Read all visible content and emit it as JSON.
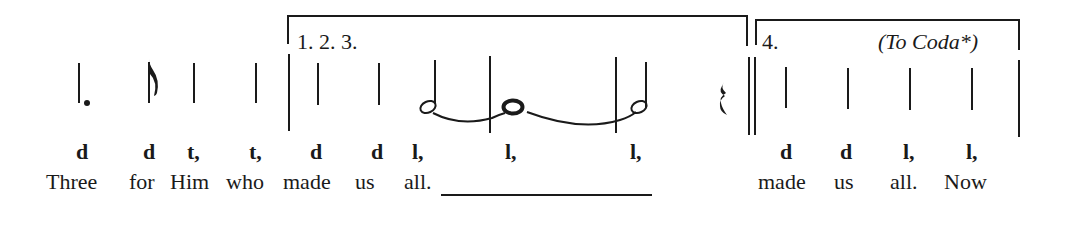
{
  "notation": {
    "endings": [
      {
        "label": "1. 2. 3."
      },
      {
        "label": "4.",
        "instruction": "(To Coda*)"
      }
    ],
    "solfa": [
      {
        "syllable": "d",
        "x": 80
      },
      {
        "syllable": "d",
        "x": 145
      },
      {
        "syllable": "t,",
        "x": 187
      },
      {
        "syllable": "t,",
        "x": 249
      },
      {
        "syllable": "d",
        "x": 310
      },
      {
        "syllable": "d",
        "x": 371
      },
      {
        "syllable": "l,",
        "x": 412
      },
      {
        "syllable": "l,",
        "x": 505
      },
      {
        "syllable": "l,",
        "x": 630
      },
      {
        "syllable": "d",
        "x": 780
      },
      {
        "syllable": "d",
        "x": 840
      },
      {
        "syllable": "l,",
        "x": 903
      },
      {
        "syllable": "l,",
        "x": 966
      }
    ],
    "lyrics": [
      {
        "text": "Three",
        "x": 46
      },
      {
        "text": "for",
        "x": 129
      },
      {
        "text": "Him",
        "x": 170
      },
      {
        "text": "who",
        "x": 226
      },
      {
        "text": "made",
        "x": 283
      },
      {
        "text": "us",
        "x": 355
      },
      {
        "text": "all.",
        "x": 404
      },
      {
        "text": "made",
        "x": 758
      },
      {
        "text": "us",
        "x": 834
      },
      {
        "text": "all.",
        "x": 890
      },
      {
        "text": "Now",
        "x": 944
      }
    ],
    "notes": [
      {
        "type": "dotted-quarter",
        "x": 79
      },
      {
        "type": "eighth",
        "x": 150
      },
      {
        "type": "quarter",
        "x": 194
      },
      {
        "type": "quarter",
        "x": 256
      },
      {
        "type": "quarter",
        "x": 318
      },
      {
        "type": "quarter",
        "x": 379
      },
      {
        "type": "half",
        "x": 434
      },
      {
        "type": "whole",
        "x": 506
      },
      {
        "type": "half",
        "x": 646
      },
      {
        "type": "quarter-rest",
        "x": 724
      },
      {
        "type": "quarter",
        "x": 786
      },
      {
        "type": "quarter",
        "x": 848
      },
      {
        "type": "quarter",
        "x": 910
      },
      {
        "type": "quarter",
        "x": 972
      }
    ],
    "barlines": [
      {
        "x": 289,
        "type": "single"
      },
      {
        "x": 489,
        "type": "single"
      },
      {
        "x": 615,
        "type": "single"
      },
      {
        "x": 749,
        "type": "double"
      },
      {
        "x": 1019,
        "type": "single"
      }
    ],
    "colors": {
      "ink": "#1a1a1a",
      "paper": "#ffffff"
    }
  }
}
